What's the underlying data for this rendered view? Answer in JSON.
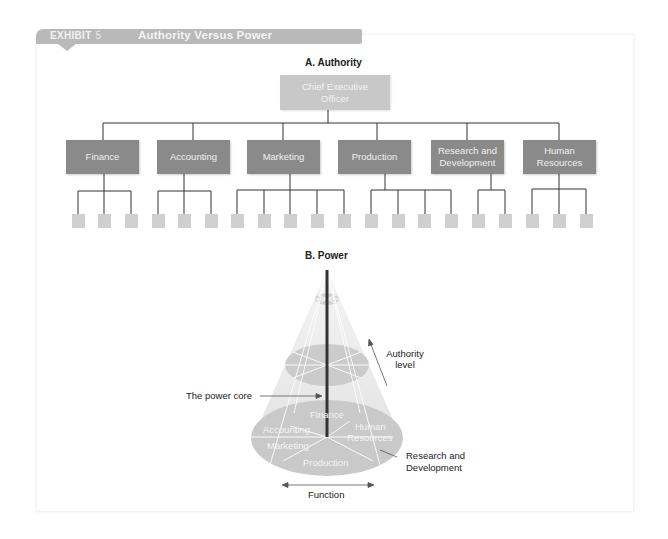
{
  "exhibit": {
    "label": "EXHIBIT",
    "number": "5",
    "title": "Authority Versus Power",
    "bar_color": "#b9b9b9"
  },
  "section_a": {
    "title": "A.  Authority",
    "ceo": {
      "line1": "Chief Executive",
      "line2": "Officer",
      "color": "#c8c8c8"
    },
    "departments": [
      {
        "line1": "Finance",
        "line2": "",
        "subunits": 3
      },
      {
        "line1": "Accounting",
        "line2": "",
        "subunits": 3
      },
      {
        "line1": "Marketing",
        "line2": "",
        "subunits": 5
      },
      {
        "line1": "Production",
        "line2": "",
        "subunits": 4
      },
      {
        "line1": "Research and",
        "line2": "Development",
        "subunits": 2
      },
      {
        "line1": "Human",
        "line2": "Resources",
        "subunits": 3
      }
    ],
    "dept_color": "#8a8a8a",
    "subunit_color": "#cfcfcf"
  },
  "section_b": {
    "title": "B.  Power",
    "labels": {
      "power_core": "The power core",
      "authority_level_1": "Authority",
      "authority_level_2": "level",
      "rd_1": "Research and",
      "rd_2": "Development",
      "function": "Function"
    },
    "base_labels": {
      "finance": "Finance",
      "accounting": "Accounting",
      "marketing": "Marketing",
      "human": "Human",
      "resources": "Resources",
      "production": "Production"
    }
  }
}
